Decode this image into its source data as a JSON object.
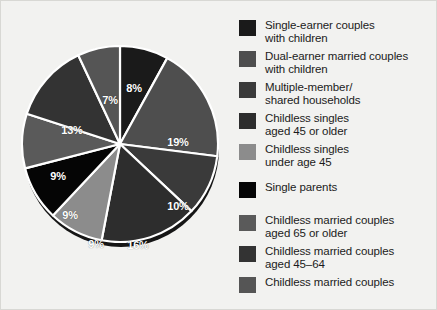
{
  "chart_data": {
    "type": "pie",
    "title": "",
    "subtitle": "",
    "xlabel": "",
    "ylabel": "",
    "grid": false,
    "legend_position": "right",
    "units": "percent",
    "total": 100,
    "background_color": "#f2f2f0",
    "slice_separator_color": "#ffffff",
    "label_color": "#ffffff",
    "start_angle_deg": 0,
    "direction": "clockwise",
    "categories": [
      "Single-earner couples with children",
      "Dual-earner married couples with children",
      "Multiple-member/ shared households",
      "Childless singles aged 45 or older",
      "Childless singles under age 45",
      "Single parents",
      "Childless married couples aged 65 or older",
      "Childless married couples aged 45–64",
      "Childless married couples"
    ],
    "values": [
      8,
      19,
      10,
      16,
      9,
      9,
      9,
      13,
      7
    ],
    "colors": [
      "#1a1a1a",
      "#4e4e4e",
      "#3a3a3a",
      "#2d2d2d",
      "#8c8c8c",
      "#050505",
      "#5a5a5a",
      "#333333",
      "#555555"
    ],
    "slices": [
      {
        "label": "8%",
        "value": 8,
        "color": "#1a1a1a",
        "category": "Single-earner couples with children",
        "label_x": 119,
        "label_y": 63
      },
      {
        "label": "19%",
        "value": 19,
        "color": "#4e4e4e",
        "category": "Dual-earner married couples with children",
        "label_x": 163,
        "label_y": 117
      },
      {
        "label": "10%",
        "value": 10,
        "color": "#3a3a3a",
        "category": "Multiple-member/ shared households",
        "label_x": 163,
        "label_y": 181
      },
      {
        "label": "16%",
        "value": 16,
        "color": "#2d2d2d",
        "category": "Childless singles aged 45 or older",
        "label_x": 123,
        "label_y": 220
      },
      {
        "label": "9%",
        "value": 9,
        "color": "#8c8c8c",
        "category": "Childless singles under age 45",
        "label_x": 81,
        "label_y": 219
      },
      {
        "label": "9%",
        "value": 9,
        "color": "#050505",
        "category": "Single parents",
        "label_x": 55,
        "label_y": 190
      },
      {
        "label": "9%",
        "value": 9,
        "color": "#5a5a5a",
        "category": "Childless married couples aged 65 or older",
        "label_x": 43,
        "label_y": 151
      },
      {
        "label": "13%",
        "value": 13,
        "color": "#333333",
        "category": "Childless married couples aged 45–64",
        "label_x": 57,
        "label_y": 105
      },
      {
        "label": "7%",
        "value": 7,
        "color": "#555555",
        "category": "Childless married couples",
        "label_x": 95,
        "label_y": 75
      }
    ]
  },
  "legend": {
    "items": [
      {
        "label": "Single-earner couples\nwith children",
        "color": "#1a1a1a",
        "top": 8
      },
      {
        "label": "Dual-earner married couples\nwith children",
        "color": "#4e4e4e",
        "top": 39
      },
      {
        "label": "Multiple-member/\nshared households",
        "color": "#3a3a3a",
        "top": 70
      },
      {
        "label": "Childless singles\naged 45 or older",
        "color": "#2d2d2d",
        "top": 101
      },
      {
        "label": "Childless singles\nunder age 45",
        "color": "#8c8c8c",
        "top": 132
      },
      {
        "label": "Single parents",
        "color": "#050505",
        "top": 170
      },
      {
        "label": "Childless married couples\naged 65 or older",
        "color": "#5a5a5a",
        "top": 203
      },
      {
        "label": "Childless married couples\naged 45–64",
        "color": "#333333",
        "top": 234
      },
      {
        "label": "Childless married couples",
        "color": "#555555",
        "top": 265
      }
    ]
  }
}
